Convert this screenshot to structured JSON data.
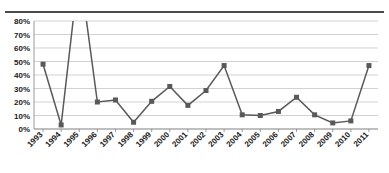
{
  "chart_data": {
    "type": "line",
    "title": "",
    "xlabel": "",
    "ylabel": "",
    "categories": [
      "1993",
      "1994",
      "1995",
      "1996",
      "1997",
      "1998",
      "1999",
      "2000",
      "2001",
      "2002",
      "2003",
      "2004",
      "2005",
      "2006",
      "2007",
      "2008",
      "2009",
      "2010",
      "2011"
    ],
    "values": [
      48,
      3,
      120,
      20,
      21.5,
      5,
      20.5,
      31.5,
      17.5,
      28.5,
      47,
      10.5,
      10,
      13,
      23.5,
      10.5,
      4.5,
      6,
      47
    ],
    "series": [
      {
        "name": "Series 1",
        "values": [
          48,
          3,
          120,
          20,
          21.5,
          5,
          20.5,
          31.5,
          17.5,
          28.5,
          47,
          10.5,
          10,
          13,
          23.5,
          10.5,
          4.5,
          6,
          47
        ]
      }
    ],
    "ylim": [
      0,
      80
    ],
    "ytick_values": [
      0,
      10,
      20,
      30,
      40,
      50,
      60,
      70,
      80
    ],
    "ytick_labels": [
      "0%",
      "10%",
      "20%",
      "30%",
      "40%",
      "50%",
      "60%",
      "70%",
      "80%"
    ],
    "xtick_labels": [
      "1993",
      "1994",
      "1995",
      "1996",
      "1997",
      "1998",
      "1999",
      "2000",
      "2001",
      "2002",
      "2003",
      "2004",
      "2005",
      "2006",
      "2007",
      "2008",
      "2009",
      "2010",
      "2011"
    ],
    "grid": true,
    "grid_axis": "y",
    "legend": false,
    "legend_position": "none",
    "marker": "square",
    "marker_color": "#595959",
    "line_color": "#595959",
    "annotations": [
      "1995 value exceeds the plotted 80% axis maximum; line is clipped at the top of the plot area"
    ]
  },
  "colors": {
    "line": "#595959",
    "marker": "#595959",
    "gridline": "#bfbfbf",
    "axis": "#808080",
    "rule": "#4a4a4a",
    "text": "#1a1a1a",
    "background": "#ffffff"
  },
  "header": {
    "title_fragment": ""
  }
}
